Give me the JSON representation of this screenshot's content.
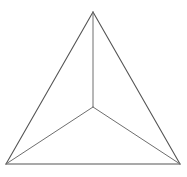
{
  "figure": {
    "name": "tetrahedron-wireframe",
    "title": "Tetrahedron wireframe line drawing",
    "background_color": "#ffffff",
    "canvas": {
      "width": 187,
      "height": 177
    },
    "stroke": {
      "outer_color": "#555555",
      "inner_color": "#6e6e6e",
      "outer_width": 1.1,
      "inner_width": 1
    },
    "points": {
      "apex": {
        "label": "apex",
        "x": 93,
        "y": 12
      },
      "bottom_left": {
        "label": "bottom-left",
        "x": 6,
        "y": 164
      },
      "bottom_right": {
        "label": "bottom-right",
        "x": 180,
        "y": 164
      },
      "center": {
        "label": "center",
        "x": 93,
        "y": 107
      }
    },
    "outer_edges": [
      {
        "name": "edge-apex-to-bottom-left",
        "from": "apex",
        "to": "bottom_left"
      },
      {
        "name": "edge-apex-to-bottom-right",
        "from": "apex",
        "to": "bottom_right"
      },
      {
        "name": "edge-bottom-base",
        "from": "bottom_left",
        "to": "bottom_right"
      }
    ],
    "inner_edges": [
      {
        "name": "edge-center-to-apex",
        "from": "center",
        "to": "apex"
      },
      {
        "name": "edge-center-to-bottom-left",
        "from": "center",
        "to": "bottom_left"
      },
      {
        "name": "edge-center-to-bottom-right",
        "from": "center",
        "to": "bottom_right"
      }
    ]
  }
}
